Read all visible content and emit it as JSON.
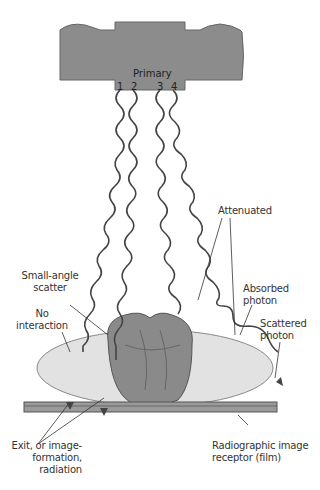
{
  "diagram": {
    "tube": {
      "label": "Primary",
      "beam_numbers": [
        "1",
        "2",
        "3",
        "4"
      ],
      "color": "#8c8c8c"
    },
    "labels": {
      "attenuated": "Attenuated",
      "small_angle_scatter": [
        "Small-angle",
        "scatter"
      ],
      "no_interaction": [
        "No",
        "interaction"
      ],
      "absorbed_photon": [
        "Absorbed",
        "photon"
      ],
      "scattered_photon": [
        "Scattered",
        "photon"
      ],
      "exit_radiation": [
        "Exit, or image-",
        "formation,",
        "radiation"
      ],
      "image_receptor": [
        "Radiographic image",
        "receptor (film)"
      ]
    },
    "colors": {
      "body": "#e2e2e2",
      "organ": "#8a8a8a",
      "film": "#9a9a9a",
      "wave": "#444444"
    }
  }
}
